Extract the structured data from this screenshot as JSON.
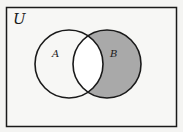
{
  "diagram": {
    "type": "venn",
    "universe_label": "U",
    "sets": [
      {
        "name": "A",
        "label": "A"
      },
      {
        "name": "B",
        "label": "B"
      }
    ],
    "shaded_region": "B minus A",
    "colors": {
      "background": "#f7f7f5",
      "stroke": "#1a1a1a",
      "shade": "#a9a9a9"
    }
  }
}
